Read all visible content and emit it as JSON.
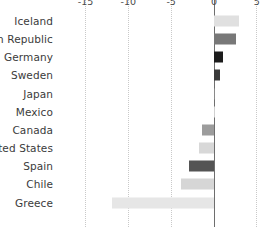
{
  "chart_data": {
    "type": "bar",
    "orientation": "horizontal",
    "title": "",
    "subtitle": "",
    "xlabel": "",
    "ylabel": "",
    "xlim": [
      -16.0,
      6.0
    ],
    "xticks": [
      -15,
      -10,
      -5,
      0,
      5
    ],
    "xtick_labels": [
      "-15",
      "-10",
      "-5",
      "0",
      "5"
    ],
    "grid": true,
    "grid_axis": "x",
    "grid_style": "dotted",
    "legend": "none",
    "zero_line": true,
    "categories": [
      "Iceland",
      "Czech Republic",
      "Germany",
      "Sweden",
      "Japan",
      "Mexico",
      "Canada",
      "United States",
      "Spain",
      "Chile",
      "Greece"
    ],
    "values": [
      2.9,
      2.6,
      1.0,
      0.7,
      0.1,
      0.05,
      -1.4,
      -1.8,
      -2.9,
      -3.9,
      -11.9
    ],
    "bar_colors": [
      "#e0e0e0",
      "#787878",
      "#1c1c1c",
      "#3a3a3a",
      "#8a8a8a",
      "#d0d0d0",
      "#9c9c9c",
      "#d8d8d8",
      "#545454",
      "#d6d6d6",
      "#e6e6e6"
    ],
    "axis_color": "#6e6e6e",
    "grid_color": "#c9c9c9",
    "label_color": "#3b3b3b",
    "tick_color": "#4a4a4a",
    "background": "#ffffff"
  }
}
